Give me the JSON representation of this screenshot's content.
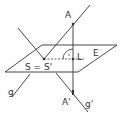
{
  "diagram": {
    "title": "",
    "labels": {
      "A": "A",
      "A_prime": "A'",
      "L": "L",
      "E": "E",
      "S": "S = S'",
      "g": "g",
      "g_prime": "g'"
    },
    "colors": {
      "stroke": "#333333",
      "background": "#ffffff"
    }
  }
}
